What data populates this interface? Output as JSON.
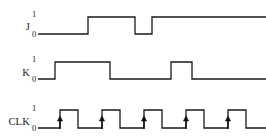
{
  "figure": {
    "background_color": "#ffffff",
    "line_color": "#1a1a1a",
    "width": 266,
    "height": 137
  },
  "signals": [
    {
      "name": "J",
      "label": "J",
      "high_label": "1",
      "low_label": "0",
      "row_index": 0
    },
    {
      "name": "K",
      "label": "K",
      "high_label": "1",
      "low_label": "0",
      "row_index": 1
    },
    {
      "name": "CLK",
      "label": "CLK",
      "high_label": "1",
      "low_label": "0",
      "row_index": 2
    }
  ],
  "chart_data": {
    "type": "line",
    "xlabel": "",
    "ylabel": "",
    "xlim": [
      0,
      266
    ],
    "ylim": [
      0,
      1
    ],
    "grid": false,
    "legend": "none",
    "series": [
      {
        "name": "J",
        "label": "J",
        "levels": [
          "1",
          "0"
        ],
        "baseline_y": 34,
        "high_y": 17,
        "x_start": 38,
        "x_end": 266,
        "transitions": [
          {
            "x": 38,
            "level": 0
          },
          {
            "x": 88,
            "level": 1
          },
          {
            "x": 135,
            "level": 0
          },
          {
            "x": 152,
            "level": 1
          },
          {
            "x": 266,
            "level": 1
          }
        ]
      },
      {
        "name": "K",
        "label": "K",
        "levels": [
          "1",
          "0"
        ],
        "baseline_y": 79,
        "high_y": 62,
        "x_start": 38,
        "x_end": 266,
        "transitions": [
          {
            "x": 38,
            "level": 0
          },
          {
            "x": 55,
            "level": 1
          },
          {
            "x": 110,
            "level": 0
          },
          {
            "x": 171,
            "level": 1
          },
          {
            "x": 192,
            "level": 0
          },
          {
            "x": 266,
            "level": 0
          }
        ]
      },
      {
        "name": "CLK",
        "label": "CLK",
        "levels": [
          "1",
          "0"
        ],
        "baseline_y": 128,
        "high_y": 110,
        "x_start": 38,
        "x_end": 266,
        "period": 42,
        "pulse_width": 18,
        "pulse_count": 5,
        "rising_edges": [
          60,
          102,
          144,
          186,
          228
        ],
        "falling_edges": [
          78,
          120,
          162,
          204,
          246
        ],
        "transitions": [
          {
            "x": 38,
            "level": 0
          },
          {
            "x": 60,
            "level": 1
          },
          {
            "x": 78,
            "level": 0
          },
          {
            "x": 102,
            "level": 1
          },
          {
            "x": 120,
            "level": 0
          },
          {
            "x": 144,
            "level": 1
          },
          {
            "x": 162,
            "level": 0
          },
          {
            "x": 186,
            "level": 1
          },
          {
            "x": 204,
            "level": 0
          },
          {
            "x": 228,
            "level": 1
          },
          {
            "x": 246,
            "level": 0
          },
          {
            "x": 266,
            "level": 0
          }
        ],
        "edge_markers": {
          "type": "rising-edge-arrow",
          "count": 5,
          "positions": [
            60,
            102,
            144,
            186,
            228
          ]
        }
      }
    ]
  },
  "labels": {
    "j_name": "J",
    "j_high": "1",
    "j_low": "0",
    "k_name": "K",
    "k_high": "1",
    "k_low": "0",
    "clk_name": "CLK",
    "clk_high": "1",
    "clk_low": "0"
  }
}
